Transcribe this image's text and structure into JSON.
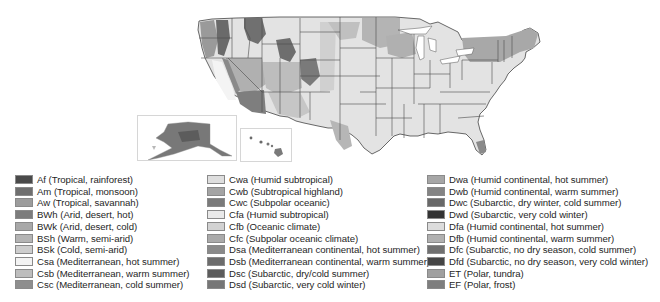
{
  "map": {
    "title": "Köppen climate classification — United States",
    "insets": [
      {
        "name": "Alaska"
      },
      {
        "name": "Hawaii"
      }
    ]
  },
  "legend": {
    "columns": [
      {
        "items": [
          {
            "code": "Af",
            "label": "Af (Tropical, rainforest)",
            "color": "#4a4a4a"
          },
          {
            "code": "Am",
            "label": "Am (Tropical, monsoon)",
            "color": "#6f6f6f"
          },
          {
            "code": "Aw",
            "label": "Aw (Tropical, savannah)",
            "color": "#9c9c9c"
          },
          {
            "code": "BWh",
            "label": "BWh (Arid, desert, hot)",
            "color": "#7c7c7c"
          },
          {
            "code": "BWk",
            "label": "BWk (Arid, desert, cold)",
            "color": "#a8a8a8"
          },
          {
            "code": "BSh",
            "label": "BSh (Warm, semi-arid)",
            "color": "#b4b4b4"
          },
          {
            "code": "BSk",
            "label": "BSk (Cold, semi-arid)",
            "color": "#cdcdcd"
          },
          {
            "code": "Csa",
            "label": "Csa (Mediterranean, hot summer)",
            "color": "#f3f3f3"
          },
          {
            "code": "Csb",
            "label": "Csb (Mediterranean, warm summer)",
            "color": "#bdbdbd"
          },
          {
            "code": "Csc",
            "label": "Csc (Mediterranean, cold summer)",
            "color": "#8e8e8e"
          }
        ]
      },
      {
        "items": [
          {
            "code": "Cwa",
            "label": "Cwa (Humid subtropical)",
            "color": "#dedede"
          },
          {
            "code": "Cwb",
            "label": "Cwb (Subtropical highland)",
            "color": "#a4a4a4"
          },
          {
            "code": "Cwc",
            "label": "Cwc (Subpolar oceanic)",
            "color": "#7a7a7a"
          },
          {
            "code": "Cfa",
            "label": "Cfa (Humid subtropical)",
            "color": "#e9e9e9"
          },
          {
            "code": "Cfb",
            "label": "Cfb (Oceanic climate)",
            "color": "#d2d2d2"
          },
          {
            "code": "Cfc",
            "label": "Cfc (Subpolar oceanic climate)",
            "color": "#aaaaaa"
          },
          {
            "code": "Dsa",
            "label": "Dsa (Mediterranean continental, hot summer)",
            "color": "#8a8a8a"
          },
          {
            "code": "Dsb",
            "label": "Dsb (Mediterranean continental, warm summer)",
            "color": "#6c6c6c"
          },
          {
            "code": "Dsc",
            "label": "Dsc (Subarctic, dry/cold summer)",
            "color": "#5c5c5c"
          },
          {
            "code": "Dsd",
            "label": "Dsd (Subarctic, very cold winter)",
            "color": "#767676"
          }
        ]
      },
      {
        "items": [
          {
            "code": "Dwa",
            "label": "Dwa (Humid continental, hot summer)",
            "color": "#a6a6a6"
          },
          {
            "code": "Dwb",
            "label": "Dwb (Humid continental, warm summer)",
            "color": "#848484"
          },
          {
            "code": "Dwc",
            "label": "Dwc (Subarctic, dry winter, cold summer)",
            "color": "#686868"
          },
          {
            "code": "Dwd",
            "label": "Dwd (Subarctic, very cold winter)",
            "color": "#333333"
          },
          {
            "code": "Dfa",
            "label": "Dfa (Humid continental, hot summer)",
            "color": "#dcdcdc"
          },
          {
            "code": "Dfb",
            "label": "Dfb (Humid continental, warm summer)",
            "color": "#b0b0b0"
          },
          {
            "code": "Dfc",
            "label": "Dfc (Subarctic, no dry season, cold summer)",
            "color": "#707070"
          },
          {
            "code": "Dfd",
            "label": "Dfd (Subarctic, no dry season, very cold winter)",
            "color": "#454545"
          },
          {
            "code": "ET",
            "label": "ET (Polar, tundra)",
            "color": "#a0a0a0"
          },
          {
            "code": "EF",
            "label": "EF (Polar, frost)",
            "color": "#7e7e7e"
          }
        ]
      }
    ]
  },
  "colors": {
    "state_border": "#3c3c3c",
    "land_default": "#e4e4e4",
    "inset_border": "#d6d6d6",
    "background": "#ffffff"
  }
}
